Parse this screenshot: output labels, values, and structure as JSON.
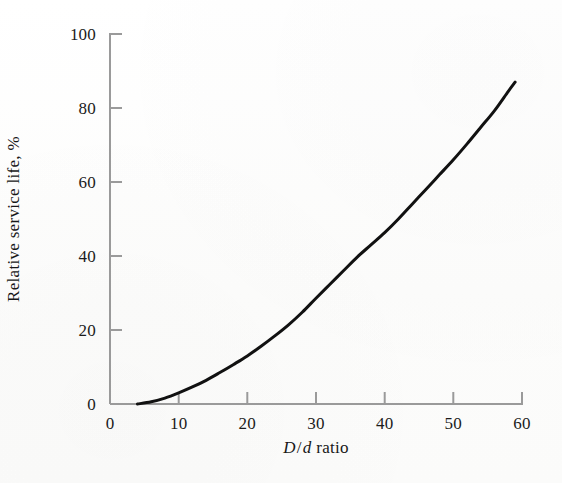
{
  "figure": {
    "background_color": "#fdfdfc",
    "axis_color": "#9a9a9a",
    "curve_color": "#111111",
    "text_color": "#1a1a1a"
  },
  "chart_data": {
    "type": "line",
    "title": "",
    "xlabel": "D/d ratio",
    "xlabel_parts": {
      "numerator": "D",
      "slash": "/",
      "denominator": "d",
      "word": "ratio"
    },
    "ylabel": "Relative service life, %",
    "xlim": [
      0,
      60
    ],
    "ylim": [
      0,
      100
    ],
    "xticks": [
      0,
      10,
      20,
      30,
      40,
      50,
      60
    ],
    "yticks": [
      0,
      20,
      40,
      60,
      80,
      100
    ],
    "xtick_labels": [
      "0",
      "10",
      "20",
      "30",
      "40",
      "50",
      "60"
    ],
    "ytick_labels": [
      "0",
      "20",
      "40",
      "60",
      "80",
      "100"
    ],
    "grid": false,
    "legend": false,
    "tick_direction": "in",
    "spines": [
      "left",
      "bottom"
    ],
    "series": [
      {
        "name": "Relative service life",
        "color": "#111111",
        "line_width": 3,
        "x": [
          4,
          6,
          8,
          10,
          12,
          14,
          16,
          18,
          20,
          22,
          24,
          26,
          28,
          30,
          32,
          34,
          36,
          38,
          40,
          42,
          44,
          46,
          48,
          50,
          52,
          54,
          56,
          58,
          59
        ],
        "y": [
          0,
          0.6,
          1.6,
          3.0,
          4.6,
          6.4,
          8.5,
          10.7,
          13.0,
          15.6,
          18.4,
          21.4,
          24.8,
          28.6,
          32.3,
          36.0,
          39.7,
          43.0,
          46.3,
          50.0,
          54.0,
          58.0,
          62.0,
          66.0,
          70.3,
          74.8,
          79.3,
          84.5,
          87.0
        ]
      }
    ],
    "annotations": []
  }
}
